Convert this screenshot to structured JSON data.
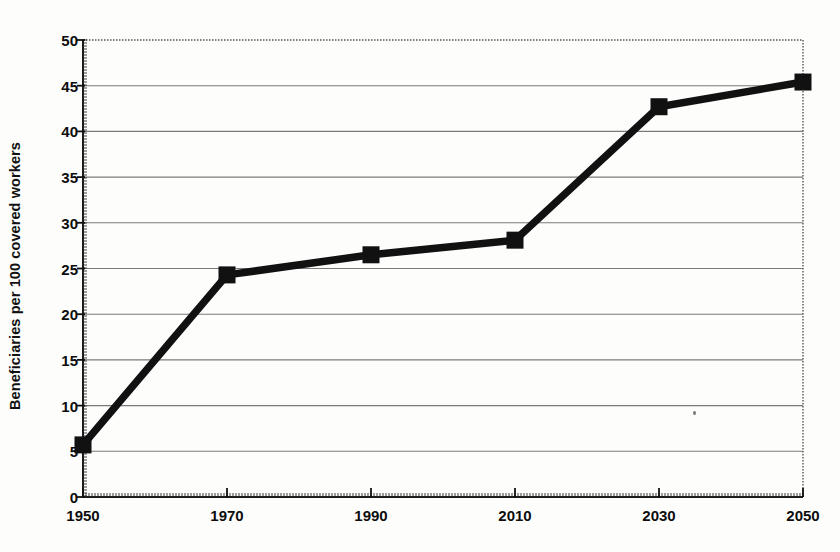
{
  "chart_data": {
    "type": "line",
    "title": "",
    "subtitle": "",
    "xlabel": "",
    "ylabel": "Beneficiaries per 100 covered workers",
    "x": [
      1950,
      1970,
      1990,
      2010,
      2030,
      2050
    ],
    "categories": [
      "1950",
      "1970",
      "1990",
      "2010",
      "2030",
      "2050"
    ],
    "values": [
      5.7,
      24.3,
      26.5,
      28.1,
      42.7,
      45.4
    ],
    "series": [
      {
        "name": "Beneficiaries per 100 covered workers",
        "values": [
          5.7,
          24.3,
          26.5,
          28.1,
          42.7,
          45.4
        ]
      }
    ],
    "xlim": [
      1950,
      2050
    ],
    "ylim": [
      0,
      50
    ],
    "y_ticks": [
      0,
      5,
      10,
      15,
      20,
      25,
      30,
      35,
      40,
      45,
      50
    ],
    "y_tick_labels": [
      "0",
      "5",
      "10",
      "15",
      "20",
      "25",
      "30",
      "35",
      "40",
      "45",
      "50"
    ],
    "x_ticks": [
      1950,
      1970,
      1990,
      2010,
      2030,
      2050
    ],
    "x_tick_labels": [
      "1950",
      "1970",
      "1990",
      "2010",
      "2030",
      "2050"
    ],
    "grid": "horizontal",
    "legend": "none",
    "marker": "square",
    "line_color": "#111111",
    "grid_color": "#7a7a7a",
    "axis_color": "#1a1a1a",
    "background_color": "#fdfdfc",
    "annotations": []
  },
  "axes": {
    "y_title": "Beneficiaries per 100 covered workers"
  }
}
